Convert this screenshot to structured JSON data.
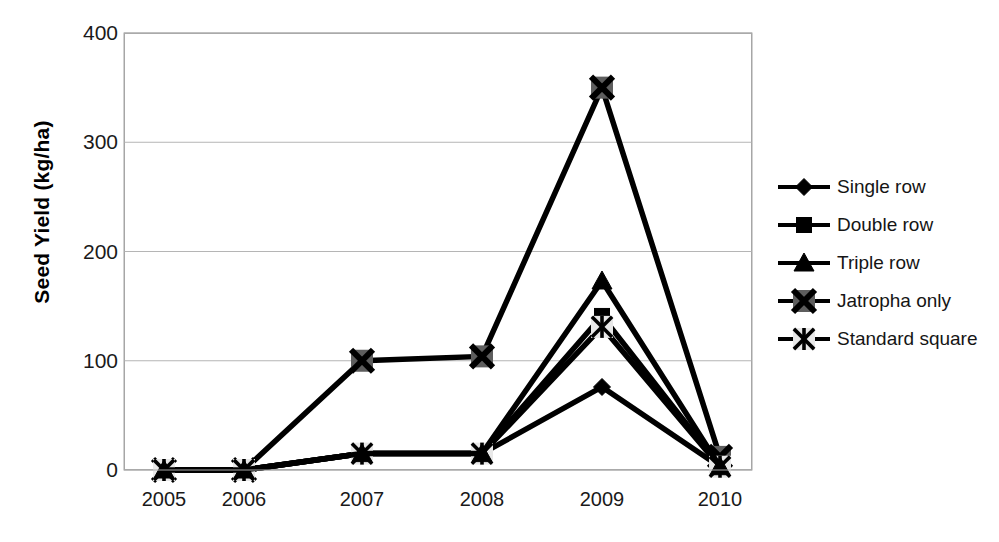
{
  "chart_data": {
    "type": "line",
    "title": "",
    "xlabel": "",
    "ylabel": "Seed Yield (kg/ha)",
    "categories": [
      "2005",
      "2006",
      "2007",
      "2008",
      "2009",
      "2010"
    ],
    "x": [
      2005,
      2006,
      2007,
      2008,
      2009,
      2010
    ],
    "ylim": [
      0,
      400
    ],
    "yticks": [
      0,
      100,
      200,
      300,
      400
    ],
    "ytick_labels": [
      "0",
      "100",
      "200",
      "300",
      "400"
    ],
    "grid": "horizontal",
    "legend_position": "right",
    "series": [
      {
        "name": "Single row",
        "marker": "diamond",
        "color": "#000000",
        "values": [
          0,
          0,
          15,
          15,
          76,
          3
        ]
      },
      {
        "name": "Double row",
        "marker": "square",
        "color": "#000000",
        "values": [
          0,
          0,
          15,
          15,
          141,
          3
        ]
      },
      {
        "name": "Triple row",
        "marker": "triangle",
        "color": "#000000",
        "values": [
          0,
          0,
          15,
          15,
          173,
          3
        ]
      },
      {
        "name": "Jatropha only",
        "marker": "x-box",
        "color": "#595959",
        "values": [
          0,
          0,
          100,
          104,
          350,
          12
        ]
      },
      {
        "name": "Standard square",
        "marker": "asterisk",
        "color": "#000000",
        "values": [
          0,
          0,
          15,
          15,
          131,
          3
        ]
      }
    ]
  }
}
